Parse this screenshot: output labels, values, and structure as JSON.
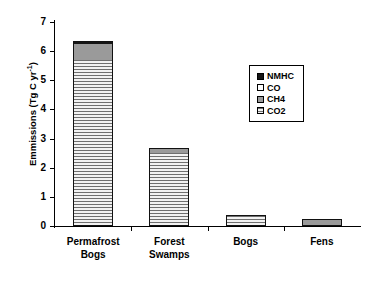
{
  "chart_data": {
    "type": "bar",
    "subtype": "stacked-bar",
    "title": "",
    "xlabel": "",
    "ylabel": "Emmissions (Tg C yr-1)",
    "ylabel_parts": {
      "main": "Emmissions (Tg C yr",
      "exponent": "-1",
      "tail": ")"
    },
    "categories": [
      "Permafrost Bogs",
      "Forest Swamps",
      "Bogs",
      "Fens"
    ],
    "category_lines": [
      [
        "Permafrost",
        "Bogs"
      ],
      [
        "Forest",
        "Swamps"
      ],
      [
        "Bogs"
      ],
      [
        "Fens"
      ]
    ],
    "series": [
      {
        "name": "CO2",
        "values": [
          5.68,
          2.52,
          0.36,
          0.0
        ]
      },
      {
        "name": "CH4",
        "values": [
          0.57,
          0.15,
          0.02,
          0.24
        ]
      },
      {
        "name": "CO",
        "values": [
          0.0,
          0.0,
          0.0,
          0.0
        ]
      },
      {
        "name": "NMHC",
        "values": [
          0.1,
          0.0,
          0.0,
          0.0
        ]
      }
    ],
    "totals": [
      6.35,
      2.67,
      0.38,
      0.24
    ],
    "ylim": [
      0,
      7
    ],
    "yticks": [
      0,
      1,
      2,
      3,
      4,
      5,
      6,
      7
    ],
    "ytick_labels": [
      "0",
      "1",
      "2",
      "3",
      "4",
      "5",
      "6",
      "7"
    ],
    "grid": false,
    "legend_position": "upper-right",
    "legend_entries": [
      {
        "label": "NMHC",
        "color": "#151515",
        "style": "solid"
      },
      {
        "label": "CO",
        "color": "#ffffff",
        "style": "solid"
      },
      {
        "label": "CH4",
        "color": "#9a9a9a",
        "style": "solid"
      },
      {
        "label": "CO2",
        "color": "#e2e2e2",
        "style": "hatched"
      }
    ]
  }
}
